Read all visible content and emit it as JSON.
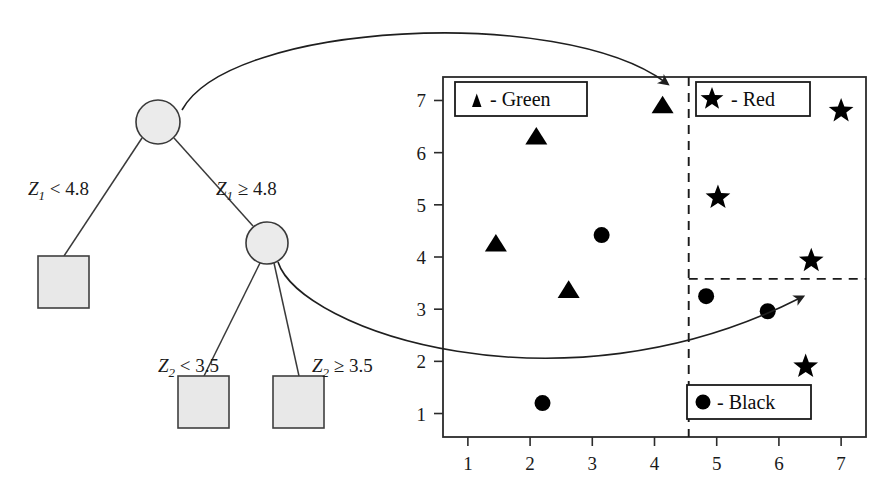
{
  "figure": {
    "tree": {
      "root_label": "",
      "branches": [
        {
          "id": "root-left",
          "var": "Z",
          "sub": "1",
          "op": "<",
          "value": "4.8",
          "text": "Z₁ < 4.8"
        },
        {
          "id": "root-right",
          "var": "Z",
          "sub": "1",
          "op": "≥",
          "value": "4.8",
          "text": "Z₁ ≥ 4.8"
        },
        {
          "id": "inner-left",
          "var": "Z",
          "sub": "2",
          "op": "<",
          "value": "3.5",
          "text": "Z₂ < 3.5"
        },
        {
          "id": "inner-right",
          "var": "Z",
          "sub": "2",
          "op": "≥",
          "value": "3.5",
          "text": "Z₂ ≥ 3.5"
        }
      ],
      "nodes": [
        {
          "id": "root",
          "shape": "circle",
          "cx": 158,
          "cy": 122,
          "r": 22
        },
        {
          "id": "inner",
          "shape": "circle",
          "cx": 267,
          "cy": 243,
          "r": 21
        }
      ],
      "leaves": [
        {
          "id": "leaf-green",
          "shape": "square",
          "x": 38,
          "y": 256,
          "w": 51,
          "h": 52
        },
        {
          "id": "leaf-black",
          "shape": "square",
          "x": 178,
          "y": 376,
          "w": 51,
          "h": 52
        },
        {
          "id": "leaf-red",
          "shape": "square",
          "x": 273,
          "y": 376,
          "w": 51,
          "h": 52
        }
      ]
    },
    "legends": [
      {
        "id": "legend-green",
        "marker": "triangle",
        "text": "- Green"
      },
      {
        "id": "legend-red",
        "marker": "star",
        "text": "- Red"
      },
      {
        "id": "legend-black",
        "marker": "circle",
        "text": "- Black"
      }
    ],
    "annotations": [
      {
        "id": "arrow-root-to-vertical-split",
        "from": "root node",
        "to": "vertical dashed split line"
      },
      {
        "id": "arrow-inner-to-horizontal-split",
        "from": "inner node",
        "to": "horizontal dashed split line"
      }
    ]
  },
  "chart_data": {
    "type": "scatter",
    "title": "",
    "xlabel": "",
    "ylabel": "",
    "xlim": [
      0.6,
      7.4
    ],
    "ylim": [
      0.55,
      7.45
    ],
    "xticks": [
      "1",
      "2",
      "3",
      "4",
      "5",
      "6",
      "7"
    ],
    "yticks": [
      "1",
      "2",
      "3",
      "4",
      "5",
      "6",
      "7"
    ],
    "xtick_values": [
      1,
      2,
      3,
      4,
      5,
      6,
      7
    ],
    "ytick_values": [
      1,
      2,
      3,
      4,
      5,
      6,
      7
    ],
    "grid": false,
    "legend_entries": [
      "▲ - Green",
      "★ - Red",
      "● - Black"
    ],
    "split_lines": [
      {
        "id": "vertical-split",
        "orientation": "vertical",
        "value": 4.55,
        "style": "dashed",
        "label": "Z1 = 4.8"
      },
      {
        "id": "horizontal-split",
        "orientation": "horizontal",
        "value": 3.58,
        "style": "dashed",
        "label": "Z2 = 3.5",
        "x_from": 4.55,
        "x_to": 7.4
      }
    ],
    "series": [
      {
        "name": "Green",
        "marker": "triangle",
        "points": [
          {
            "x": 1.45,
            "y": 4.27
          },
          {
            "x": 2.1,
            "y": 6.32
          },
          {
            "x": 2.62,
            "y": 3.38
          },
          {
            "x": 4.13,
            "y": 6.92
          }
        ]
      },
      {
        "name": "Red",
        "marker": "star",
        "points": [
          {
            "x": 5.02,
            "y": 5.14
          },
          {
            "x": 6.43,
            "y": 1.9
          },
          {
            "x": 6.52,
            "y": 3.93
          },
          {
            "x": 7.0,
            "y": 6.8
          }
        ]
      },
      {
        "name": "Black",
        "marker": "circle",
        "points": [
          {
            "x": 2.2,
            "y": 1.2
          },
          {
            "x": 3.15,
            "y": 4.42
          },
          {
            "x": 4.83,
            "y": 3.25
          },
          {
            "x": 5.82,
            "y": 2.96
          }
        ]
      }
    ]
  }
}
